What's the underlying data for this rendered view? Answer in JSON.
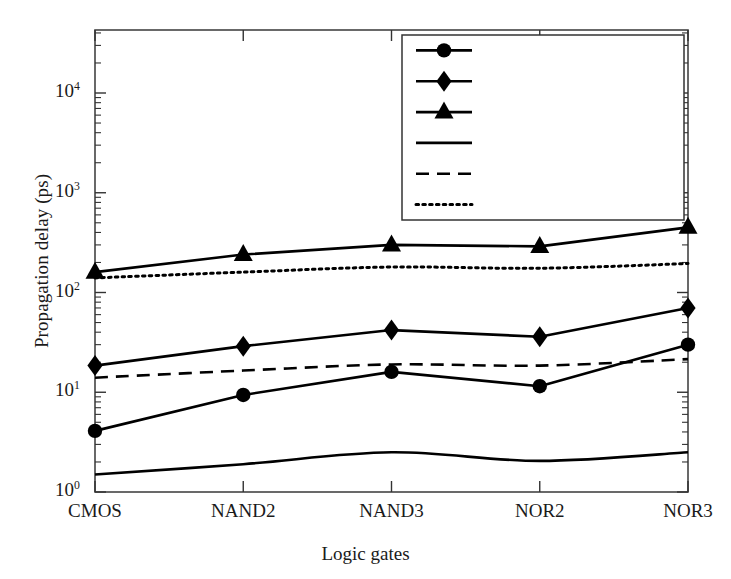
{
  "chart_data": {
    "type": "line",
    "title": "",
    "xlabel": "Logic gates",
    "ylabel": "Propagation delay (ps)",
    "categories": [
      "CMOS",
      "NAND2",
      "NAND3",
      "NOR2",
      "NOR3"
    ],
    "yscale": "log",
    "ylim": [
      1,
      30000
    ],
    "ytick_values": [
      1,
      10,
      100,
      1000,
      10000
    ],
    "ytick_labels": [
      "10",
      "10",
      "10",
      "10",
      "10"
    ],
    "ytick_exponents": [
      "0",
      "1",
      "2",
      "3",
      "4"
    ],
    "grid": false,
    "legend_position": "top-right",
    "series": [
      {
        "name": "1 µm wire (MOSFET)",
        "marker": "circle",
        "line": "solid",
        "color": "#000000",
        "values": [
          4.1,
          9.4,
          16.0,
          11.5,
          30.0
        ]
      },
      {
        "name": "10 µm wire (MOSFET)",
        "marker": "diamond",
        "line": "solid",
        "color": "#000000",
        "values": [
          18.5,
          29.0,
          42.0,
          36.0,
          70.0
        ]
      },
      {
        "name": "100 µm wire (MOSFET)",
        "marker": "triangle",
        "line": "solid",
        "color": "#000000",
        "values": [
          160,
          240,
          300,
          290,
          450
        ]
      },
      {
        "name": "1 µm wire (CNFET)",
        "marker": "none",
        "line": "solid",
        "color": "#000000",
        "values": [
          1.5,
          1.9,
          2.5,
          2.05,
          2.5
        ]
      },
      {
        "name": "10 µm wire (CNFET)",
        "marker": "none",
        "line": "dashed",
        "color": "#000000",
        "values": [
          14.0,
          16.5,
          19.0,
          18.5,
          21.5
        ]
      },
      {
        "name": "100 µm wire (CNFET)",
        "marker": "none",
        "line": "dotted",
        "color": "#000000",
        "values": [
          140,
          160,
          180,
          175,
          195
        ]
      }
    ]
  },
  "axes": {
    "x_label": "Logic gates",
    "y_label": "Propagation delay (ps)"
  },
  "legend": {
    "items": [
      {
        "label": "1 µm wire (MOSFET)"
      },
      {
        "label": "10 µm wire (MOSFET)"
      },
      {
        "label": "100 µm wire (MOSFET)"
      },
      {
        "label": "1 µm wire (CNFET)"
      },
      {
        "label": "10 µm wire (CNFET)"
      },
      {
        "label": "100 µm wire (CNFET)"
      }
    ]
  }
}
